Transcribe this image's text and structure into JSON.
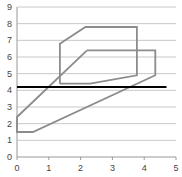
{
  "chart_data": {
    "type": "line",
    "title": "",
    "xlabel": "",
    "ylabel": "",
    "xlim": [
      0,
      5
    ],
    "ylim": [
      0,
      9
    ],
    "x_ticks": [
      "0",
      "1",
      "2",
      "3",
      "4",
      "5"
    ],
    "y_ticks": [
      "0",
      "1",
      "2",
      "3",
      "4",
      "5",
      "6",
      "7",
      "8",
      "9"
    ],
    "grid": "horizontal",
    "legend": "none",
    "series": [
      {
        "name": "Series A",
        "color": "#8c8c8c",
        "points": [
          [
            1.35,
            4.4
          ],
          [
            1.35,
            6.8
          ],
          [
            2.15,
            7.8
          ],
          [
            3.77,
            7.8
          ],
          [
            3.77,
            4.9
          ],
          [
            2.3,
            4.4
          ],
          [
            1.35,
            4.4
          ]
        ]
      },
      {
        "name": "Series B",
        "color": "#8c8c8c",
        "points": [
          [
            2.2,
            6.4
          ],
          [
            4.35,
            6.4
          ],
          [
            4.35,
            4.9
          ],
          [
            0.5,
            1.5
          ],
          [
            0,
            1.5
          ],
          [
            0,
            2.4
          ],
          [
            2.2,
            6.4
          ]
        ]
      },
      {
        "name": "Threshold",
        "color": "#000000",
        "points": [
          [
            0,
            4.2
          ],
          [
            4.7,
            4.2
          ]
        ]
      }
    ]
  }
}
